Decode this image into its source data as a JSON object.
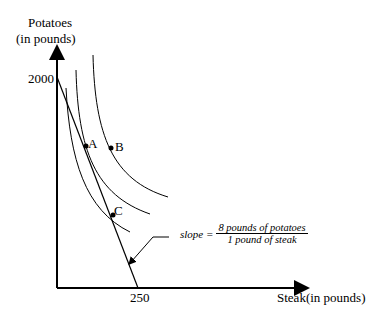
{
  "diagram": {
    "y_axis": {
      "label_line1": "Potatoes",
      "label_line2": "(in pounds)",
      "intercept_label": "2000"
    },
    "x_axis": {
      "label": "Steak(in pounds)",
      "intercept_label": "250"
    },
    "points": [
      {
        "label": "A",
        "on": "middle indifference curve, tangent to budget line"
      },
      {
        "label": "B",
        "on": "outer indifference curve"
      },
      {
        "label": "C",
        "on": "inner indifference curve, on budget line"
      }
    ],
    "slope_annotation": {
      "prefix": "slope =",
      "numerator": "8 pounds of  potatoes",
      "denominator": "1 pound of steak"
    },
    "budget_line": {
      "y_intercept": 2000,
      "x_intercept": 250
    },
    "indifference_curves": 3
  }
}
